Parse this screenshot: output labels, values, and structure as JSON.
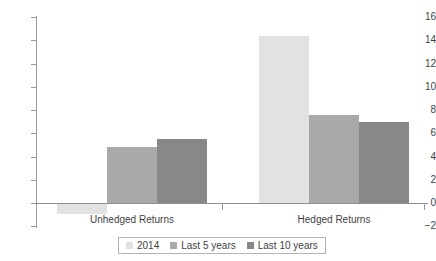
{
  "chart_data": {
    "type": "bar",
    "title": "",
    "subtitle": "",
    "xlabel": "",
    "ylabel": "",
    "categories": [
      "Unhedged Returns",
      "Hedged Returns"
    ],
    "series": [
      {
        "name": "2014",
        "values": [
          -0.9,
          14.4
        ],
        "color": "#e2e2e2"
      },
      {
        "name": "Last 5 years",
        "values": [
          4.8,
          7.6
        ],
        "color": "#a9a9a9"
      },
      {
        "name": "Last 10 years",
        "values": [
          5.5,
          7.0
        ],
        "color": "#888888"
      }
    ],
    "ylim": [
      -2,
      16
    ],
    "ytick_values": [
      16,
      14,
      12,
      10,
      8,
      6,
      4,
      2,
      0,
      -2
    ],
    "ytick_labels": [
      "16",
      "14",
      "12",
      "10",
      "8",
      "6",
      "4",
      "2",
      "0",
      "−2"
    ],
    "grid": false,
    "legend_position": "bottom"
  },
  "legend": {
    "items": [
      {
        "label": "2014",
        "color": "#e2e2e2"
      },
      {
        "label": "Last 5 years",
        "color": "#a9a9a9"
      },
      {
        "label": "Last 10 years",
        "color": "#888888"
      }
    ]
  },
  "axis": {
    "line_color": "#9a9a9a",
    "baseline_color": "#8f8f8f",
    "text_color": "#3f3f3f"
  }
}
